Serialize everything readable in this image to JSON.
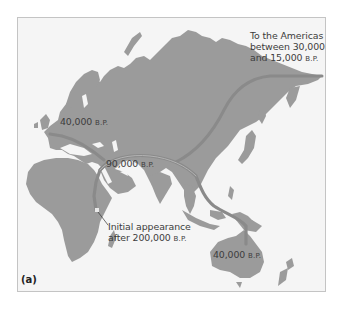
{
  "figure": {
    "panel_label": "(a)",
    "colors": {
      "background": "#f5f5f5",
      "land": "#9b9b9b",
      "route": "#8a8a8a",
      "route_highlight": "#b0b0b0",
      "text": "#3c3c3c",
      "border": "#c4c4c4"
    }
  },
  "labels": {
    "americas": {
      "line1": "To the Americas",
      "line2": "between 30,000",
      "line3_num": "and 15,000",
      "line3_unit": "B.P."
    },
    "europe": {
      "num": "40,000",
      "unit": "B.P."
    },
    "middle_east": {
      "num": "90,000",
      "unit": "B.P."
    },
    "africa": {
      "line1": "Initial appearance",
      "line2_num": "after 200,000",
      "line2_unit": "B.P."
    },
    "australia": {
      "num": "40,000",
      "unit": "B.P."
    }
  },
  "map_regions": [
    "Europe",
    "Asia",
    "Africa",
    "Australia",
    "New Zealand",
    "Japan",
    "Southeast Asia",
    "Arabia",
    "India",
    "Madagascar",
    "British Isles",
    "Scandinavia"
  ]
}
